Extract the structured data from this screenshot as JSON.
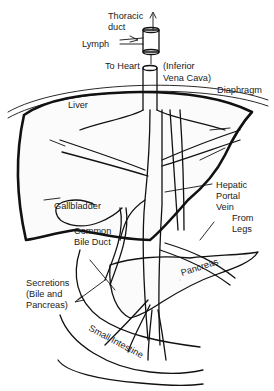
{
  "diagram": {
    "colors": {
      "ink": "#111111",
      "background": "#ffffff"
    },
    "labels": {
      "thoracic_duct": [
        "Thoracic",
        "duct"
      ],
      "lymph": "Lymph",
      "to_heart": "To Heart",
      "inferior_vena_cava": [
        "(Inferior",
        "Vena Cava)"
      ],
      "diaphragm": "Diaphragm",
      "liver": "Liver",
      "gallbladder": "Gallbladder",
      "hepatic_portal_vein": [
        "Hepatic",
        "Portal",
        "Vein"
      ],
      "from_legs": [
        "From",
        "Legs"
      ],
      "common_bile_duct": [
        "Common",
        "Bile Duct"
      ],
      "secretions": [
        "Secretions",
        "(Bile and",
        "Pancreas)"
      ],
      "pancreas": "Pancreas",
      "small_intestine": "Small Intestine"
    }
  }
}
